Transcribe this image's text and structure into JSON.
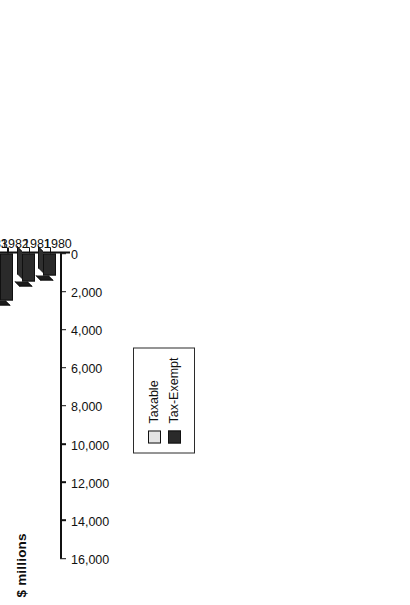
{
  "chart_data": {
    "type": "bar",
    "title": "",
    "orientation": "vertical-rendered-rotated",
    "xlabel": "",
    "ylabel": "$ millions",
    "categories": [
      "1980",
      "1981",
      "1982",
      "1983",
      "1984",
      "1985",
      "1986",
      "1987",
      "1988",
      "1989",
      "1990",
      "1991",
      "1992",
      "1993"
    ],
    "series": [
      {
        "name": "Tax-Exempt",
        "color": "#2a2a2a",
        "values": [
          1150,
          1450,
          2450,
          3000,
          3150,
          10250,
          7150,
          5800,
          7350,
          7050,
          8000,
          7300,
          14600,
          8250
        ]
      },
      {
        "name": "Taxable",
        "color": "#e4e4e4",
        "values": [
          0,
          0,
          0,
          0,
          0,
          0,
          200,
          200,
          250,
          350,
          200,
          650,
          250,
          400
        ]
      }
    ],
    "stacked": true,
    "totals": [
      1150,
      1450,
      2450,
      3000,
      3150,
      10250,
      7350,
      6000,
      7600,
      7400,
      8200,
      7950,
      14850,
      8650
    ],
    "value_axis": {
      "min": 0,
      "max": 16000,
      "ticks": [
        0,
        2000,
        4000,
        6000,
        8000,
        10000,
        12000,
        14000,
        16000
      ],
      "tick_labels": [
        "0",
        "2,000",
        "4,000",
        "6,000",
        "8,000",
        "10,000",
        "12,000",
        "14,000",
        "16,000"
      ]
    },
    "grid": false,
    "legend": {
      "position": "inside-upper-left",
      "entries": [
        {
          "label": "Taxable",
          "color": "#e4e4e4"
        },
        {
          "label": "Tax-Exempt",
          "color": "#2a2a2a"
        }
      ]
    }
  },
  "axis": {
    "title": "$ millions"
  },
  "legend": {
    "items": [
      {
        "label": "Taxable",
        "swatch": "#e4e4e4"
      },
      {
        "label": "Tax-Exempt",
        "swatch": "#2a2a2a"
      }
    ]
  }
}
